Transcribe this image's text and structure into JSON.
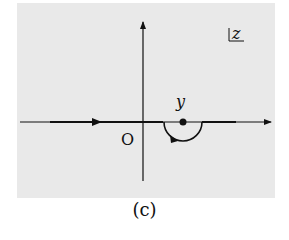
{
  "figure": {
    "caption": "(c)",
    "plane_label": "z",
    "origin_label": "O",
    "point_label": "y",
    "colors": {
      "panel": "#e9e9e9",
      "ink": "#111111"
    }
  }
}
